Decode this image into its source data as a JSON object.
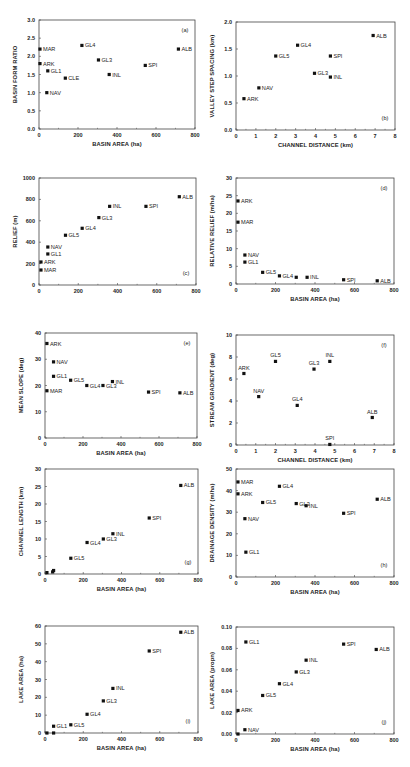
{
  "chart_data": [
    {
      "id": "a",
      "type": "scatter",
      "panel_label": "(a)",
      "xlabel": "BASIN AREA (ha)",
      "ylabel": "BASIN FORM RATIO",
      "xlim": [
        0,
        800
      ],
      "ylim": [
        0,
        3.0
      ],
      "xticks": [
        0,
        200,
        400,
        600,
        800
      ],
      "yticks": [
        0.0,
        0.5,
        1.0,
        1.5,
        2.0,
        2.5,
        3.0
      ],
      "ytick_labels": [
        "0.0",
        "0.5",
        "1.0",
        "1.5",
        "2.0",
        "2.5",
        "3.0"
      ],
      "label_pos": "top-right",
      "points": [
        {
          "name": "MAR",
          "x": 5,
          "y": 2.2
        },
        {
          "name": "ARK",
          "x": 5,
          "y": 1.8
        },
        {
          "name": "GL1",
          "x": 45,
          "y": 1.6
        },
        {
          "name": "CLE",
          "x": 135,
          "y": 1.4
        },
        {
          "name": "NAV",
          "x": 40,
          "y": 1.0
        },
        {
          "name": "GL4",
          "x": 220,
          "y": 2.3
        },
        {
          "name": "GL3",
          "x": 305,
          "y": 1.9
        },
        {
          "name": "INL",
          "x": 360,
          "y": 1.5
        },
        {
          "name": "SPI",
          "x": 545,
          "y": 1.75
        },
        {
          "name": "ALB",
          "x": 715,
          "y": 2.2
        }
      ]
    },
    {
      "id": "b",
      "type": "scatter",
      "panel_label": "(b)",
      "xlabel": "CHANNEL DISTANCE (km)",
      "ylabel": "VALLEY STEP SPACING (km)",
      "xlim": [
        0,
        8
      ],
      "ylim": [
        0,
        2.0
      ],
      "xticks": [
        0,
        1,
        2,
        3,
        4,
        5,
        6,
        7,
        8
      ],
      "yticks": [
        0.0,
        0.5,
        1.0,
        1.5,
        2.0
      ],
      "ytick_labels": [
        "0.0",
        "0.5",
        "1.0",
        "1.5",
        "2.0"
      ],
      "label_pos": "bottom-right",
      "points": [
        {
          "name": "ARK",
          "x": 0.4,
          "y": 0.58
        },
        {
          "name": "NAV",
          "x": 1.15,
          "y": 0.78
        },
        {
          "name": "GL5",
          "x": 2.0,
          "y": 1.37
        },
        {
          "name": "GL4",
          "x": 3.1,
          "y": 1.57
        },
        {
          "name": "GL3",
          "x": 3.95,
          "y": 1.05
        },
        {
          "name": "SPI",
          "x": 4.75,
          "y": 1.37
        },
        {
          "name": "INL",
          "x": 4.75,
          "y": 0.98
        },
        {
          "name": "ALB",
          "x": 6.9,
          "y": 1.75
        }
      ]
    },
    {
      "id": "c",
      "type": "scatter",
      "panel_label": "(c)",
      "xlabel": "",
      "ylabel": "RELIEF (m)",
      "xlim": [
        0,
        800
      ],
      "ylim": [
        0,
        1000
      ],
      "xticks": [
        0,
        200,
        400,
        600,
        800
      ],
      "yticks": [
        0,
        200,
        400,
        600,
        800,
        1000
      ],
      "ytick_labels": [
        "0",
        "200",
        "400",
        "600",
        "800",
        "1000"
      ],
      "label_pos": "bottom-right",
      "points": [
        {
          "name": "MAR",
          "x": 10,
          "y": 140
        },
        {
          "name": "ARK",
          "x": 10,
          "y": 215
        },
        {
          "name": "GL1",
          "x": 45,
          "y": 290
        },
        {
          "name": "NAV",
          "x": 45,
          "y": 355
        },
        {
          "name": "GL5",
          "x": 135,
          "y": 465
        },
        {
          "name": "GL4",
          "x": 220,
          "y": 530
        },
        {
          "name": "GL3",
          "x": 305,
          "y": 630
        },
        {
          "name": "INL",
          "x": 360,
          "y": 735
        },
        {
          "name": "SPI",
          "x": 545,
          "y": 735
        },
        {
          "name": "ALB",
          "x": 715,
          "y": 825
        }
      ]
    },
    {
      "id": "d",
      "type": "scatter",
      "panel_label": "(d)",
      "xlabel": "BASIN AREA (ha)",
      "ylabel": "RELATIVE RELIEF (m/ha)",
      "xlim": [
        0,
        800
      ],
      "ylim": [
        0,
        30
      ],
      "xticks": [
        0,
        200,
        400,
        600,
        800
      ],
      "yticks": [
        0,
        5,
        10,
        15,
        20,
        25,
        30
      ],
      "ytick_labels": [
        "0",
        "5",
        "10",
        "15",
        "20",
        "25",
        "30"
      ],
      "label_pos": "top-right",
      "points": [
        {
          "name": "ARK",
          "x": 10,
          "y": 23.5
        },
        {
          "name": "MAR",
          "x": 10,
          "y": 17.5
        },
        {
          "name": "NAV",
          "x": 45,
          "y": 8.2
        },
        {
          "name": "GL1",
          "x": 45,
          "y": 6.2
        },
        {
          "name": "GL5",
          "x": 135,
          "y": 3.3
        },
        {
          "name": "GL4",
          "x": 220,
          "y": 2.3
        },
        {
          "name": "",
          "x": 305,
          "y": 1.9
        },
        {
          "name": "INL",
          "x": 360,
          "y": 1.9
        },
        {
          "name": "SPI",
          "x": 545,
          "y": 1.2
        },
        {
          "name": "ALB",
          "x": 715,
          "y": 0.9
        }
      ]
    },
    {
      "id": "e",
      "type": "scatter",
      "panel_label": "(e)",
      "xlabel": "BASIN AREA (ha)",
      "ylabel": "MEAN SLOPE (deg)",
      "xlim": [
        0,
        800
      ],
      "ylim": [
        0,
        40
      ],
      "xticks": [
        0,
        200,
        400,
        600,
        800
      ],
      "yticks": [
        0,
        10,
        20,
        30,
        40
      ],
      "ytick_labels": [
        "0",
        "10",
        "20",
        "30",
        "40"
      ],
      "label_pos": "top-right",
      "points": [
        {
          "name": "ARK",
          "x": 10,
          "y": 36
        },
        {
          "name": "NAV",
          "x": 45,
          "y": 29
        },
        {
          "name": "GL1",
          "x": 45,
          "y": 23.5
        },
        {
          "name": "MAR",
          "x": 10,
          "y": 18
        },
        {
          "name": "GL5",
          "x": 135,
          "y": 22
        },
        {
          "name": "GL4",
          "x": 220,
          "y": 20
        },
        {
          "name": "GL3",
          "x": 305,
          "y": 20
        },
        {
          "name": "INL",
          "x": 355,
          "y": 21.5
        },
        {
          "name": "SPI",
          "x": 545,
          "y": 17.5
        },
        {
          "name": "ALB",
          "x": 710,
          "y": 17.2
        }
      ]
    },
    {
      "id": "f",
      "type": "scatter",
      "panel_label": "(f)",
      "xlabel": "CHANNEL DISTANCE (km)",
      "ylabel": "STREAM GRADIENT (deg)",
      "xlim": [
        0,
        8
      ],
      "ylim": [
        0,
        10
      ],
      "xticks": [
        0,
        1,
        2,
        3,
        4,
        5,
        6,
        7,
        8
      ],
      "yticks": [
        0,
        2,
        4,
        6,
        8,
        10
      ],
      "ytick_labels": [
        "0",
        "2",
        "4",
        "6",
        "8",
        "10"
      ],
      "label_pos": "top-right",
      "label_above": true,
      "points": [
        {
          "name": "ARK",
          "x": 0.4,
          "y": 6.5
        },
        {
          "name": "NAV",
          "x": 1.15,
          "y": 4.4
        },
        {
          "name": "GL5",
          "x": 2.0,
          "y": 7.6
        },
        {
          "name": "GL4",
          "x": 3.1,
          "y": 3.6
        },
        {
          "name": "GL3",
          "x": 3.95,
          "y": 6.9
        },
        {
          "name": "INL",
          "x": 4.75,
          "y": 7.6
        },
        {
          "name": "SPI",
          "x": 4.75,
          "y": 0.05
        },
        {
          "name": "ALB",
          "x": 6.9,
          "y": 2.5
        }
      ]
    },
    {
      "id": "g",
      "type": "scatter",
      "panel_label": "(g)",
      "xlabel": "BASIN AREA (ha)",
      "ylabel": "CHANNEL LENGTH (km)",
      "xlim": [
        0,
        800
      ],
      "ylim": [
        0,
        30
      ],
      "xticks": [
        0,
        200,
        400,
        600,
        800
      ],
      "yticks": [
        0,
        5,
        10,
        15,
        20,
        25,
        30
      ],
      "ytick_labels": [
        "0",
        "5",
        "10",
        "15",
        "20",
        "25",
        "30"
      ],
      "label_pos": "bottom-right",
      "points": [
        {
          "name": "",
          "x": 10,
          "y": 0.4
        },
        {
          "name": "",
          "x": 40,
          "y": 0.6
        },
        {
          "name": "",
          "x": 45,
          "y": 1.0
        },
        {
          "name": "GL5",
          "x": 135,
          "y": 4.5
        },
        {
          "name": "GL4",
          "x": 220,
          "y": 9.0
        },
        {
          "name": "GL3",
          "x": 305,
          "y": 10.0
        },
        {
          "name": "INL",
          "x": 355,
          "y": 11.5
        },
        {
          "name": "SPI",
          "x": 545,
          "y": 16.0
        },
        {
          "name": "ALB",
          "x": 710,
          "y": 25.3
        }
      ]
    },
    {
      "id": "h",
      "type": "scatter",
      "panel_label": "(h)",
      "xlabel": "BASIN AREA (ha)",
      "ylabel": "DRAINAGE DENSITY (m/ha)",
      "xlim": [
        0,
        800
      ],
      "ylim": [
        0,
        50
      ],
      "xticks": [
        0,
        200,
        400,
        600,
        800
      ],
      "yticks": [
        0,
        10,
        20,
        30,
        40,
        50
      ],
      "ytick_labels": [
        "0",
        "10",
        "20",
        "30",
        "40",
        "50"
      ],
      "label_pos": "bottom-right",
      "points": [
        {
          "name": "MAR",
          "x": 10,
          "y": 44
        },
        {
          "name": "ARK",
          "x": 10,
          "y": 38.5
        },
        {
          "name": "NAV",
          "x": 45,
          "y": 27
        },
        {
          "name": "GL1",
          "x": 50,
          "y": 11.5
        },
        {
          "name": "GL5",
          "x": 135,
          "y": 34.5
        },
        {
          "name": "GL4",
          "x": 220,
          "y": 42
        },
        {
          "name": "GL3",
          "x": 305,
          "y": 34
        },
        {
          "name": "INL",
          "x": 355,
          "y": 33
        },
        {
          "name": "SPI",
          "x": 545,
          "y": 29.5
        },
        {
          "name": "ALB",
          "x": 715,
          "y": 36
        }
      ]
    },
    {
      "id": "i",
      "type": "scatter",
      "panel_label": "(i)",
      "xlabel": "BASIN AREA (ha)",
      "ylabel": "LAKE AREA (ha)",
      "xlim": [
        0,
        800
      ],
      "ylim": [
        0,
        60
      ],
      "xticks": [
        0,
        200,
        400,
        600,
        800
      ],
      "yticks": [
        0,
        10,
        20,
        30,
        40,
        50,
        60
      ],
      "ytick_labels": [
        "0",
        "10",
        "20",
        "30",
        "40",
        "50",
        "60"
      ],
      "label_pos": "bottom-right",
      "points": [
        {
          "name": "",
          "x": 10,
          "y": 0
        },
        {
          "name": "",
          "x": 45,
          "y": 0
        },
        {
          "name": "GL1",
          "x": 45,
          "y": 3.8
        },
        {
          "name": "GL5",
          "x": 135,
          "y": 4.6
        },
        {
          "name": "GL4",
          "x": 220,
          "y": 10.5
        },
        {
          "name": "GL3",
          "x": 305,
          "y": 18
        },
        {
          "name": "INL",
          "x": 355,
          "y": 25
        },
        {
          "name": "SPI",
          "x": 545,
          "y": 46
        },
        {
          "name": "ALB",
          "x": 710,
          "y": 56.5
        }
      ]
    },
    {
      "id": "j",
      "type": "scatter",
      "panel_label": "(j)",
      "xlabel": "BASIN AREA (ha)",
      "ylabel": "LAKE AREA (propn)",
      "xlim": [
        0,
        800
      ],
      "ylim": [
        0,
        0.1
      ],
      "xticks": [
        0,
        200,
        400,
        600,
        800
      ],
      "yticks": [
        0,
        0.02,
        0.04,
        0.06,
        0.08,
        0.1
      ],
      "ytick_labels": [
        "0.00",
        "0.02",
        "0.04",
        "0.06",
        "0.08",
        "0.10"
      ],
      "label_pos": "bottom-right",
      "points": [
        {
          "name": "",
          "x": 10,
          "y": 0.0
        },
        {
          "name": "NAV",
          "x": 45,
          "y": 0.004
        },
        {
          "name": "ARK",
          "x": 10,
          "y": 0.022
        },
        {
          "name": "GL1",
          "x": 50,
          "y": 0.086
        },
        {
          "name": "GL5",
          "x": 135,
          "y": 0.036
        },
        {
          "name": "GL4",
          "x": 220,
          "y": 0.047
        },
        {
          "name": "GL3",
          "x": 305,
          "y": 0.058
        },
        {
          "name": "INL",
          "x": 355,
          "y": 0.069
        },
        {
          "name": "SPI",
          "x": 545,
          "y": 0.084
        },
        {
          "name": "ALB",
          "x": 710,
          "y": 0.079
        }
      ]
    }
  ],
  "layout": {
    "panels": [
      {
        "id": "a",
        "left": 39,
        "top": 20,
        "width": 156,
        "height": 109
      },
      {
        "id": "b",
        "left": 236,
        "top": 22,
        "width": 159,
        "height": 108
      },
      {
        "id": "c",
        "left": 39,
        "top": 178,
        "width": 157,
        "height": 107
      },
      {
        "id": "d",
        "left": 236,
        "top": 178,
        "width": 158,
        "height": 106
      },
      {
        "id": "e",
        "left": 45,
        "top": 333,
        "width": 152,
        "height": 105
      },
      {
        "id": "f",
        "left": 236,
        "top": 335,
        "width": 158,
        "height": 110
      },
      {
        "id": "g",
        "left": 45,
        "top": 469,
        "width": 153,
        "height": 105
      },
      {
        "id": "h",
        "left": 236,
        "top": 469,
        "width": 158,
        "height": 108
      },
      {
        "id": "i",
        "left": 45,
        "top": 626,
        "width": 153,
        "height": 107
      },
      {
        "id": "j",
        "left": 236,
        "top": 627,
        "width": 158,
        "height": 107
      }
    ]
  }
}
